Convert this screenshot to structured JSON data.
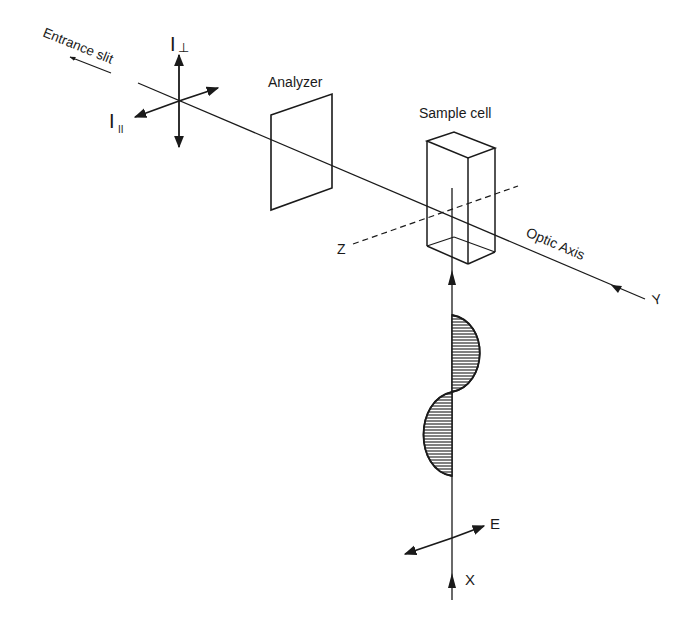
{
  "diagram": {
    "type": "optical-setup",
    "labels": {
      "entrance_slit": "Entrance slit",
      "i_perp": "I",
      "i_perp_sub": "⊥",
      "i_par": "I",
      "i_par_sub": "II",
      "analyzer": "Analyzer",
      "sample_cell": "Sample cell",
      "optic_axis": "Optic Axis",
      "axis_y": "Y",
      "axis_z": "Z",
      "axis_x": "X",
      "field_e": "E"
    },
    "colors": {
      "ink": "#1a1a1a",
      "background": "#ffffff"
    }
  }
}
